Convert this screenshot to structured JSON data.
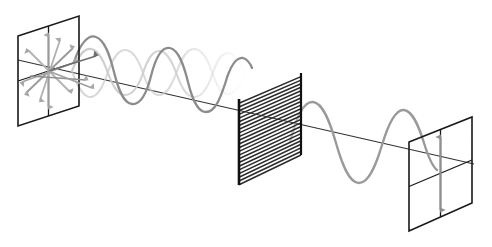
{
  "figure": {
    "background_color": "#ffffff",
    "width": 492,
    "height": 247
  },
  "colors": {
    "frame_stroke": "#1a1a1a",
    "axis_stroke": "#333333",
    "wave_vertical": "#8c8c8c",
    "wave_horizontal": "#c9c9c9",
    "wave_transmitted": "#9a9a9a",
    "polarizer_grating": "#2b2b2b",
    "polarizer_edge": "#111111",
    "arrow_unpolarized": "#999999",
    "arrow_polarized": "#8f8f8f"
  },
  "panels": [
    {
      "id": "source-panel",
      "label": "Unpolarized light source plane",
      "role": "incoming-unpolarized",
      "geometry": {
        "top_left": [
          18,
          36
        ],
        "top_right": [
          79,
          16
        ],
        "bottom_right": [
          79,
          106
        ],
        "bottom_left": [
          18,
          126
        ]
      },
      "has_cross_divider": true,
      "arrow_count": 8,
      "arrow_type": "double-headed-radial"
    },
    {
      "id": "polarizer-panel",
      "label": "Linear polarizer with horizontal grating",
      "role": "polarizer",
      "geometry": {
        "top_left": [
          239,
          99
        ],
        "top_right": [
          301,
          73
        ],
        "bottom_right": [
          301,
          155
        ],
        "bottom_left": [
          239,
          185
        ]
      },
      "has_cross_divider": false,
      "grating_lines": 23,
      "grating_orientation": "horizontal"
    },
    {
      "id": "screen-panel",
      "label": "Plane-polarized output plane",
      "role": "outgoing-polarized",
      "geometry": {
        "top_left": [
          409,
          142
        ],
        "top_right": [
          472,
          117
        ],
        "bottom_right": [
          472,
          203
        ],
        "bottom_left": [
          409,
          231
        ]
      },
      "has_cross_divider": true,
      "arrow_count": 1,
      "arrow_type": "double-headed-vertical"
    }
  ],
  "axis": {
    "label": "propagation axis",
    "start": [
      18,
      60
    ],
    "end": [
      474,
      164
    ],
    "stroke_width": 1.1
  },
  "waves": [
    {
      "id": "wave-vertical-component",
      "label": "Vertical polarization component (transmitted)",
      "color_key": "wave_vertical",
      "plane": "vertical",
      "amplitude": 38,
      "cycles": 3.0,
      "x_start": 72,
      "x_end": 246,
      "opacity": 1.0
    },
    {
      "id": "wave-horizontal-component",
      "label": "Horizontal polarization component (absorbed)",
      "color_key": "wave_horizontal",
      "plane": "horizontal",
      "amplitude": 34,
      "cycles": 3.0,
      "x_start": 72,
      "x_end": 246,
      "opacity": 0.85
    },
    {
      "id": "wave-transmitted",
      "label": "Transmitted plane-polarized wave",
      "color_key": "wave_transmitted",
      "plane": "vertical",
      "amplitude": 42,
      "cycles": 2.0,
      "x_start": 292,
      "x_end": 432,
      "opacity": 1.0
    }
  ],
  "annotations": {
    "source_description": "Unpolarized beam: electric field vectors in all transverse directions",
    "polarizer_description": "Polarizing filter transmits only the component parallel to its axis",
    "screen_description": "Plane-polarized beam: electric field oscillates in a single vertical plane"
  }
}
